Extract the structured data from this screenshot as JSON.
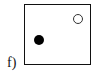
{
  "panel": {
    "label": "f)",
    "points": [
      {
        "type": "filled",
        "color": "#000000"
      },
      {
        "type": "hollow",
        "color": "#ffffff"
      }
    ]
  }
}
